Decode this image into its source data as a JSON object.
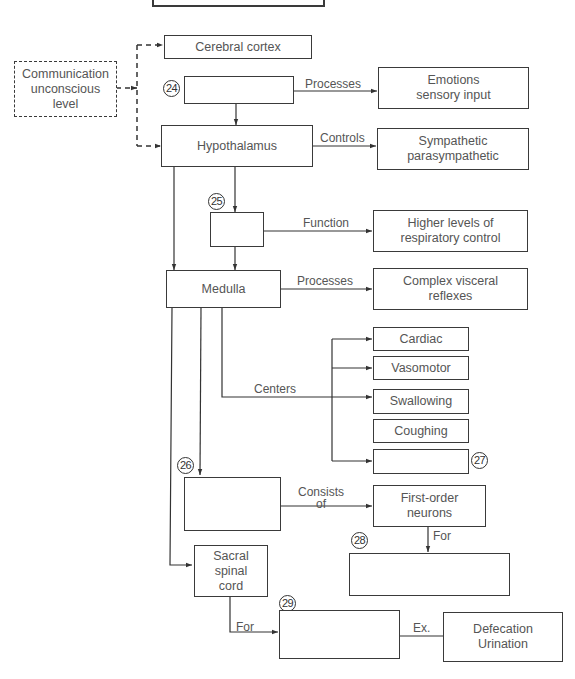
{
  "diagram": {
    "nodes": {
      "top_box": {
        "label": ""
      },
      "communication": {
        "label": "Communication\nunconscious\nlevel"
      },
      "cerebral_cortex": {
        "label": "Cerebral cortex"
      },
      "blank_24": {
        "label": "",
        "number": "24"
      },
      "emotions": {
        "label": "Emotions\nsensory input"
      },
      "hypothalamus": {
        "label": "Hypothalamus"
      },
      "sympathetic": {
        "label": "Sympathetic\nparasympathetic"
      },
      "blank_25": {
        "label": "",
        "number": "25"
      },
      "respiratory": {
        "label": "Higher levels of\nrespiratory control"
      },
      "medulla": {
        "label": "Medulla"
      },
      "visceral": {
        "label": "Complex visceral\nreflexes"
      },
      "cardiac": {
        "label": "Cardiac"
      },
      "vasomotor": {
        "label": "Vasomotor"
      },
      "swallowing": {
        "label": "Swallowing"
      },
      "coughing": {
        "label": "Coughing"
      },
      "blank_27": {
        "label": "",
        "number": "27"
      },
      "blank_26": {
        "label": "",
        "number": "26"
      },
      "first_order": {
        "label": "First-order\nneurons"
      },
      "blank_28": {
        "label": "",
        "number": "28"
      },
      "sacral": {
        "label": "Sacral\nspinal\ncord"
      },
      "blank_29": {
        "label": "",
        "number": "29"
      },
      "defecation": {
        "label": "Defecation\nUrination"
      }
    },
    "edge_labels": {
      "processes_1": "Processes",
      "controls": "Controls",
      "function": "Function",
      "processes_2": "Processes",
      "centers": "Centers",
      "consists_of": "Consists\nof",
      "for_1": "For",
      "for_2": "For",
      "ex": "Ex."
    }
  }
}
